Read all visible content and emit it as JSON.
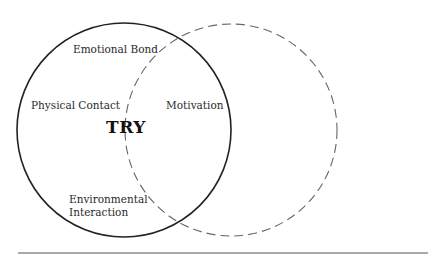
{
  "diagram": {
    "type": "venn",
    "circles": [
      {
        "id": "solid",
        "cx": 124,
        "cy": 130,
        "r": 107,
        "style": "solid",
        "color": "#222222"
      },
      {
        "id": "dashed",
        "cx": 231,
        "cy": 130,
        "r": 106,
        "style": "dashed",
        "color": "#666666"
      }
    ],
    "center_label": "TRY",
    "labels": {
      "emotional_bond": "Emotional Bond",
      "physical_contact": "Physical Contact",
      "motivation": "Motivation",
      "environmental_line1": "Environmental",
      "environmental_line2": "Interaction"
    },
    "baseline": {
      "x1": 18,
      "x2": 428,
      "y": 253,
      "color": "#555555"
    }
  }
}
